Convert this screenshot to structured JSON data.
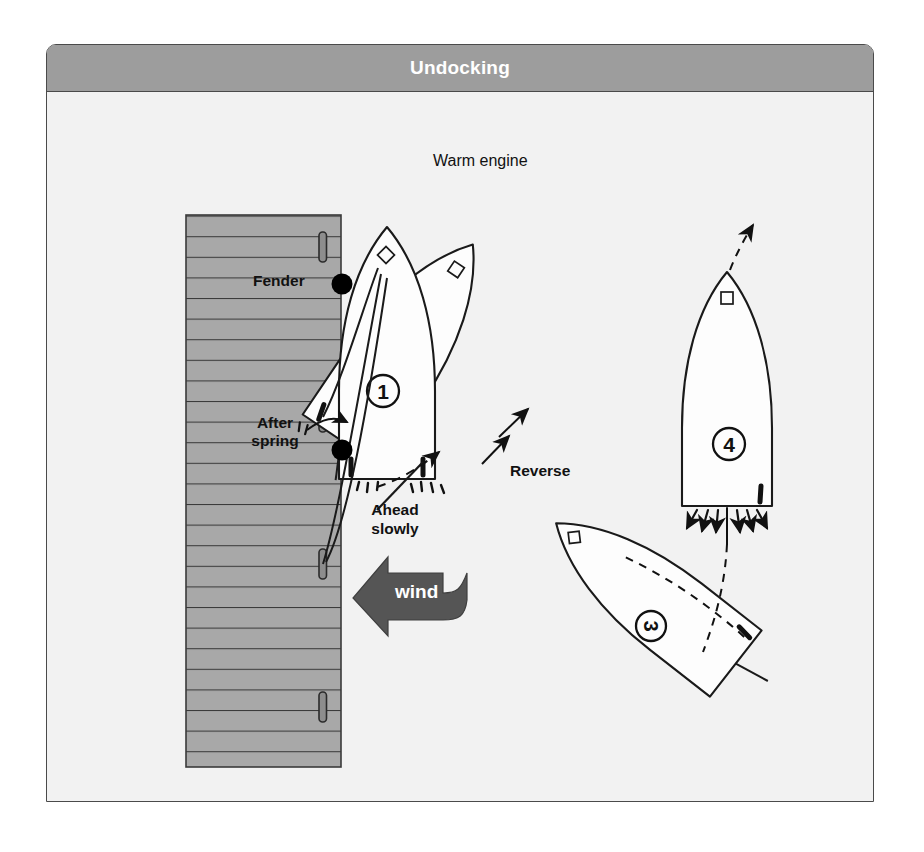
{
  "panel": {
    "title": "Undocking",
    "title_bar_color": "#9d9d9d",
    "border_color": "#4a4a4a",
    "background_color": "#f2f2f2"
  },
  "colors": {
    "dock_fill": "#a8a8a8",
    "dock_line": "#3a3a3a",
    "boat_fill": "#fdfdfd",
    "boat_outline": "#1a1a1a",
    "wind_arrow": "#555555",
    "fender_dot": "#000000",
    "bollard": "#8d8d8d",
    "label_text": "#111111"
  },
  "labels": {
    "warm_engine": "Warm engine",
    "fender": "Fender",
    "after_spring_line1": "After",
    "after_spring_line2": "spring",
    "ahead_slowly_line1": "Ahead",
    "ahead_slowly_line2": "slowly",
    "reverse": "Reverse",
    "wind": "wind"
  },
  "boats": [
    {
      "id": "1",
      "number": "1",
      "state": "alongside-dock",
      "heading_deg": 0,
      "note": "moored alongside with fenders and after spring"
    },
    {
      "id": "2",
      "number": "2",
      "state": "bow-out-pivoting",
      "heading_deg": 35,
      "note": "stern swings out, engine ahead slowly against spring"
    },
    {
      "id": "3",
      "number": "3",
      "state": "reversing-clear",
      "heading_deg": -52,
      "note": "backing away from the dock"
    },
    {
      "id": "4",
      "number": "4",
      "state": "motoring-away",
      "heading_deg": 0,
      "note": "engine ahead, departing under power"
    }
  ],
  "annotations": [
    {
      "name": "wind-direction",
      "text": "wind",
      "direction": "to-the-left"
    },
    {
      "name": "reverse-thrust",
      "text": "Reverse",
      "direction": "up-right"
    },
    {
      "name": "ahead-slowly-thrust",
      "text": "Ahead slowly",
      "direction": "prop-wash-astern"
    },
    {
      "name": "departure-track",
      "text": "",
      "direction": "up"
    }
  ]
}
